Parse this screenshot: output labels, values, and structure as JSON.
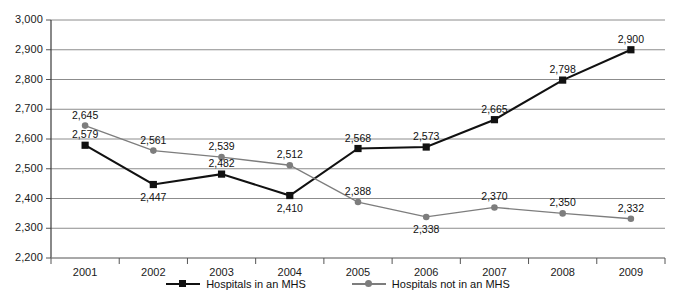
{
  "chart_data": {
    "type": "line",
    "title": "",
    "subtitle": "",
    "xlabel": "",
    "ylabel": "",
    "categories": [
      "2001",
      "2002",
      "2003",
      "2004",
      "2005",
      "2006",
      "2007",
      "2008",
      "2009"
    ],
    "ylim": [
      2200,
      3000
    ],
    "yticks": [
      2200,
      2300,
      2400,
      2500,
      2600,
      2700,
      2800,
      2900,
      3000
    ],
    "ytick_labels": [
      "2,200",
      "2,300",
      "2,400",
      "2,500",
      "2,600",
      "2,700",
      "2,800",
      "2,900",
      "3,000"
    ],
    "grid": true,
    "grid_axis": "y",
    "legend_position": "bottom",
    "series": [
      {
        "name": "Hospitals in an MHS",
        "color": "#111111",
        "marker": "square",
        "values": [
          2579,
          2447,
          2482,
          2410,
          2568,
          2573,
          2665,
          2798,
          2900
        ],
        "labels": [
          "2,579",
          "2,447",
          "2,482",
          "2,410",
          "2,568",
          "2,573",
          "2,665",
          "2,798",
          "2,900"
        ]
      },
      {
        "name": "Hospitals not in an MHS",
        "color": "#7d7d7d",
        "marker": "circle",
        "values": [
          2645,
          2561,
          2539,
          2512,
          2388,
          2338,
          2370,
          2350,
          2332
        ],
        "labels": [
          "2,645",
          "2,561",
          "2,539",
          "2,512",
          "2,388",
          "2,338",
          "2,370",
          "2,350",
          "2,332"
        ]
      }
    ]
  },
  "legend": {
    "items": [
      {
        "label": "Hospitals in an MHS",
        "marker": "square-marker-icon"
      },
      {
        "label": "Hospitals not in an MHS",
        "marker": "circle-marker-icon"
      }
    ]
  },
  "colors": {
    "series_in_mhs": "#111111",
    "series_not_in_mhs": "#7d7d7d",
    "gridline": "#8c8c8c",
    "axis": "#555555",
    "background": "#ffffff",
    "text": "#111111"
  }
}
